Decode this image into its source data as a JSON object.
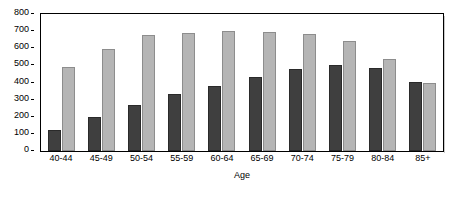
{
  "chart_data": {
    "type": "bar",
    "title": "",
    "subtitle": "",
    "xlabel": "Age",
    "ylabel": "",
    "categories": [
      "40-44",
      "45-49",
      "50-54",
      "55-59",
      "60-64",
      "65-69",
      "70-74",
      "75-79",
      "80-84",
      "85+"
    ],
    "series": [
      {
        "name": "series-1",
        "color": "#3f3f3f",
        "values": [
          120,
          200,
          270,
          335,
          380,
          435,
          480,
          500,
          482,
          405
        ]
      },
      {
        "name": "series-2",
        "color": "#b5b5b5",
        "values": [
          490,
          595,
          680,
          690,
          700,
          697,
          682,
          642,
          535,
          395
        ]
      }
    ],
    "ylim": [
      0,
      800
    ],
    "ytick_step": 100,
    "yticks": [
      0,
      100,
      200,
      300,
      400,
      500,
      600,
      700,
      800
    ],
    "ytick_labels": [
      "0",
      "100",
      "200",
      "300",
      "400",
      "500",
      "600",
      "700",
      "800"
    ],
    "grid": false,
    "legend": null,
    "legend_position": "none",
    "annotations": []
  },
  "axes": {
    "x_title": "Age"
  },
  "colors": {
    "series_1": "#3f3f3f",
    "series_2": "#b5b5b5",
    "axis": "#000000",
    "background": "#ffffff"
  }
}
